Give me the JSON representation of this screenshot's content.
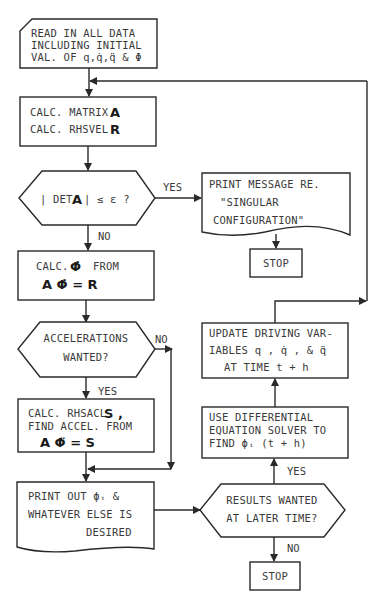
{
  "flowchart": {
    "nodes": {
      "read_data": {
        "shape": "card",
        "lines": [
          "READ IN ALL DATA",
          "INCLUDING INITIAL",
          "VAL. OF q,q̇,q̈ & Φ"
        ]
      },
      "calc_matrix": {
        "shape": "process",
        "line1_text": "CALC. MATRIX",
        "line1_symbol": "A",
        "line2_text": "CALC. RHSVEL",
        "line2_symbol": "R"
      },
      "det_check": {
        "shape": "decision",
        "text_pre": "| DET",
        "symbol": "A",
        "text_post": "|  ≤ ε  ?"
      },
      "print_singular": {
        "shape": "document",
        "lines": [
          "PRINT MESSAGE RE.",
          "\"SINGULAR",
          "CONFIGURATION\""
        ]
      },
      "stop_1": {
        "shape": "process",
        "text": "STOP"
      },
      "calc_phidot": {
        "shape": "process",
        "line1_text": "CALC.",
        "line1_symbol": "Φ̇",
        "line1_suffix": "FROM",
        "equation": "A Φ̇  =  R"
      },
      "accel_wanted": {
        "shape": "decision",
        "lines": [
          "ACCELERATIONS",
          "WANTED?"
        ]
      },
      "calc_accel": {
        "shape": "process",
        "line1_text": "CALC. RHSACL",
        "line1_symbol": "S ,",
        "line2_text": "FIND ACCEL. FROM",
        "equation": "A Φ̈  =  S"
      },
      "print_out": {
        "shape": "document",
        "lines": [
          "PRINT OUT  ϕᵢ &",
          "WHATEVER ELSE IS",
          "DESIRED"
        ]
      },
      "results_later": {
        "shape": "decision",
        "lines": [
          "RESULTS WANTED",
          "AT LATER TIME?"
        ]
      },
      "ode_solver": {
        "shape": "process",
        "lines": [
          "USE DIFFERENTIAL",
          "EQUATION SOLVER TO",
          "FIND ϕᵢ (t + h)"
        ]
      },
      "update_vars": {
        "shape": "process",
        "lines": [
          "UPDATE DRIVING VAR-",
          "IABLES q , q̇ , & q̈",
          "AT TIME t + h"
        ]
      },
      "stop_2": {
        "shape": "process",
        "text": "STOP"
      }
    },
    "edge_labels": {
      "det_yes": "YES",
      "det_no": "NO",
      "accel_no": "NO",
      "accel_yes": "YES",
      "results_yes": "YES",
      "results_no": "NO"
    },
    "edges": [
      [
        "read_data",
        "calc_matrix"
      ],
      [
        "calc_matrix",
        "det_check"
      ],
      [
        "det_check",
        "print_singular",
        "YES"
      ],
      [
        "print_singular",
        "stop_1"
      ],
      [
        "det_check",
        "calc_phidot",
        "NO"
      ],
      [
        "calc_phidot",
        "accel_wanted"
      ],
      [
        "accel_wanted",
        "calc_accel",
        "YES"
      ],
      [
        "accel_wanted",
        "print_out",
        "NO"
      ],
      [
        "calc_accel",
        "print_out"
      ],
      [
        "print_out",
        "results_later"
      ],
      [
        "results_later",
        "ode_solver",
        "YES"
      ],
      [
        "results_later",
        "stop_2",
        "NO"
      ],
      [
        "ode_solver",
        "update_vars"
      ],
      [
        "update_vars",
        "calc_matrix"
      ]
    ]
  }
}
